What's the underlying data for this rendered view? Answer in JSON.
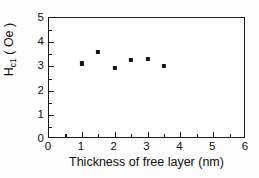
{
  "chart_data": {
    "type": "scatter",
    "title": "",
    "xlabel": "Thickness of free layer (nm)",
    "ylabel_main": "H",
    "ylabel_sub": "c1",
    "ylabel_unit": "( Oe )",
    "ylabel_full": "H_c1 ( Oe )",
    "x": [
      1.0,
      1.5,
      2.0,
      2.5,
      3.0,
      3.5
    ],
    "y": [
      3.12,
      3.6,
      2.93,
      3.27,
      3.32,
      3.02
    ],
    "points": [
      {
        "x": 1.0,
        "y": 3.12
      },
      {
        "x": 1.5,
        "y": 3.6
      },
      {
        "x": 2.0,
        "y": 2.93
      },
      {
        "x": 2.5,
        "y": 3.27
      },
      {
        "x": 3.0,
        "y": 3.32
      },
      {
        "x": 3.5,
        "y": 3.02
      }
    ],
    "xlim": [
      0,
      6
    ],
    "ylim": [
      0,
      5
    ],
    "xticks": [
      0,
      1,
      2,
      3,
      4,
      5,
      6
    ],
    "xticklabels": [
      "0",
      "1",
      "2",
      "3",
      "4",
      "5",
      "6"
    ],
    "xminorticks": [
      0.5,
      1.5,
      2.5,
      3.5,
      4.5,
      5.5
    ],
    "yticks": [
      0,
      1,
      2,
      3,
      4,
      5
    ],
    "yticklabels": [
      "0",
      "1",
      "2",
      "3",
      "4",
      "5"
    ],
    "yminorticks": [
      0.5,
      1.5,
      2.5,
      3.5,
      4.5
    ],
    "grid": false,
    "legend": null,
    "marker": "square",
    "marker_color": "#131313",
    "axis_color": "#1a1a1a",
    "background_color": "#ffffff"
  }
}
